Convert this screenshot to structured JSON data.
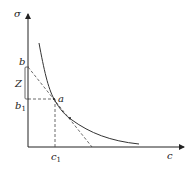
{
  "diagram": {
    "type": "economics-indifference-curve",
    "axes": {
      "y_label": "σ",
      "x_label": "c"
    },
    "points": {
      "b": {
        "label": "b"
      },
      "b1": {
        "label": "b",
        "subscript": "1"
      },
      "a": {
        "label": "a"
      },
      "c1": {
        "label": "c",
        "subscript": "1"
      }
    },
    "bracket": {
      "label": "Z"
    },
    "colors": {
      "line": "#222222",
      "curve": "#333333",
      "dashed": "#444444",
      "bracket": "#555555"
    }
  }
}
